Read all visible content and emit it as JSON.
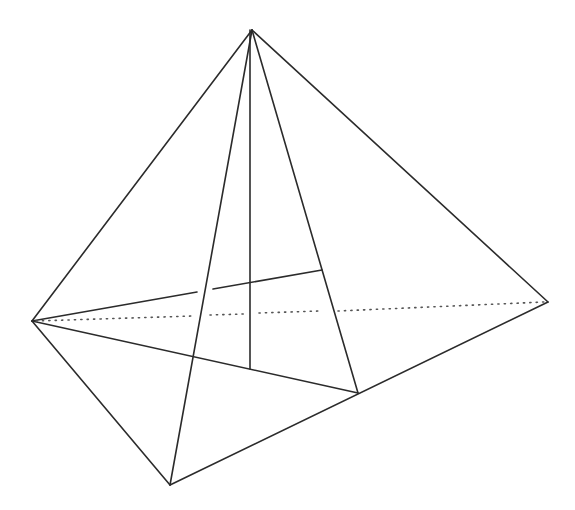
{
  "diagram": {
    "type": "pyramid-wireframe",
    "stroke_color": "#2b2b2b",
    "background": "#ffffff",
    "vertices": {
      "apex": [
        252,
        30
      ],
      "left": [
        32,
        321
      ],
      "right": [
        548,
        302
      ],
      "bottom": [
        170,
        485
      ],
      "mid_bottom_right": [
        358,
        393
      ],
      "altitude_foot": [
        250,
        369
      ],
      "inner_point": [
        322,
        270
      ]
    },
    "solid_edges": [
      {
        "name": "apex-left",
        "d": "M252 30 L32 321"
      },
      {
        "name": "apex-right",
        "d": "M252 30 L548 302"
      },
      {
        "name": "apex-bottom",
        "d": "M252 30 L170 485"
      },
      {
        "name": "apex-mid",
        "d": "M252 30 L358 393"
      },
      {
        "name": "altitude",
        "d": "M250 30 L250 369"
      },
      {
        "name": "left-bottom",
        "d": "M32 321 L170 485"
      },
      {
        "name": "bottom-right",
        "d": "M170 485 L548 302"
      },
      {
        "name": "left-mid",
        "d": "M32 321 L358 393"
      },
      {
        "name": "left-inner-a",
        "d": "M32 321 L197 292"
      },
      {
        "name": "left-inner-b",
        "d": "M213 289 L322 270"
      }
    ],
    "hidden_edges": [
      {
        "name": "left-right-hidden-a",
        "d": "M36 321 L193 316"
      },
      {
        "name": "left-right-hidden-b",
        "d": "M210 315 L244 314"
      },
      {
        "name": "left-right-hidden-c",
        "d": "M259 313 L320 311"
      },
      {
        "name": "left-right-hidden-d",
        "d": "M338 311 L544 302"
      }
    ]
  }
}
